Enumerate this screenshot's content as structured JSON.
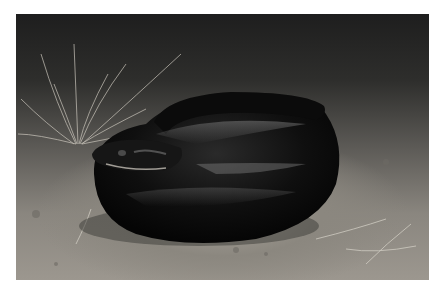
{
  "image": {
    "description": "Photograph of a coiled glossy black snake on sandy ground at night, with tufts of dry grass in the background",
    "subject": "coiled black snake",
    "colors": {
      "border": "#ffffff",
      "ground": "#9c978f",
      "background_dark": "#1e1e1e",
      "snake": "#0d0d0d",
      "snake_highlight": "#6a6a6a",
      "grass": "#c8c4ba"
    }
  }
}
